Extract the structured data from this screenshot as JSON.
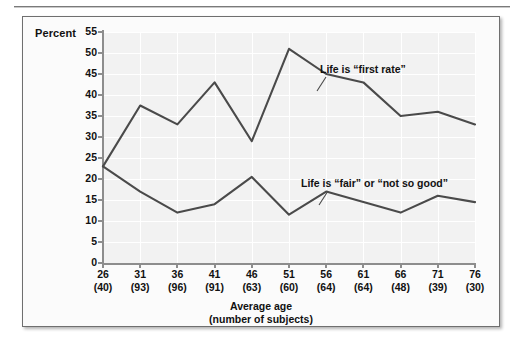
{
  "figure": {
    "y_axis_title": "Percent",
    "x_axis_title_line1": "Average age",
    "x_axis_title_line2": "(number of subjects)",
    "line_color": "#4a4a4a",
    "plot_background": "#f2f2f2",
    "grid_color": "#ffffff"
  },
  "chart_data": {
    "type": "line",
    "title": "",
    "xlabel": "Average age (number of subjects)",
    "ylabel": "Percent",
    "ylim": [
      0,
      55
    ],
    "yticks": [
      0,
      5,
      10,
      15,
      20,
      25,
      30,
      35,
      40,
      45,
      50,
      55
    ],
    "grid": true,
    "legend_position": "inline-annotations",
    "categories": [
      "26",
      "31",
      "36",
      "41",
      "46",
      "51",
      "56",
      "61",
      "66",
      "71",
      "76"
    ],
    "subject_counts": [
      "(40)",
      "(93)",
      "(96)",
      "(91)",
      "(63)",
      "(60)",
      "(64)",
      "(64)",
      "(48)",
      "(39)",
      "(30)"
    ],
    "tick_labels": [
      {
        "age": "26",
        "n": "(40)"
      },
      {
        "age": "31",
        "n": "(93)"
      },
      {
        "age": "36",
        "n": "(96)"
      },
      {
        "age": "41",
        "n": "(91)"
      },
      {
        "age": "46",
        "n": "(63)"
      },
      {
        "age": "51",
        "n": "(60)"
      },
      {
        "age": "56",
        "n": "(64)"
      },
      {
        "age": "61",
        "n": "(64)"
      },
      {
        "age": "66",
        "n": "(48)"
      },
      {
        "age": "71",
        "n": "(39)"
      },
      {
        "age": "76",
        "n": "(30)"
      }
    ],
    "series": [
      {
        "name": "Life is “first rate”",
        "values": [
          23,
          37.5,
          33,
          43,
          29,
          51,
          45,
          43,
          35,
          36,
          33
        ]
      },
      {
        "name": "Life is “fair” or “not so good”",
        "values": [
          23,
          17,
          12,
          14,
          20.5,
          11.5,
          17,
          14.5,
          12,
          16,
          14.5
        ]
      }
    ],
    "annotations": [
      {
        "text": "Life is “first rate”",
        "series": 0
      },
      {
        "text": "Life is “fair” or “not so good”",
        "series": 1
      }
    ]
  }
}
